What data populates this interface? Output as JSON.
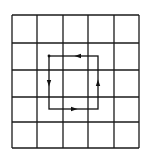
{
  "diagram": {
    "type": "grid-with-closed-loop",
    "grid": {
      "rows": 5,
      "cols": 5,
      "x_lines": [
        12,
        37,
        63,
        88,
        114,
        139
      ],
      "y_lines": [
        15,
        43,
        70,
        97,
        122,
        148
      ],
      "line_color": "#1a1a1a"
    },
    "loop": {
      "corners": {
        "left": 49,
        "top": 56,
        "right": 98,
        "bottom": 109
      },
      "direction": "counterclockwise",
      "line_color": "#111111",
      "arrows": [
        {
          "side": "top",
          "x": 78,
          "y": 56,
          "points": "left"
        },
        {
          "side": "left",
          "x": 49,
          "y": 83,
          "points": "down"
        },
        {
          "side": "bottom",
          "x": 74,
          "y": 109,
          "points": "right"
        },
        {
          "side": "right",
          "x": 98,
          "y": 83,
          "points": "up"
        }
      ]
    }
  }
}
